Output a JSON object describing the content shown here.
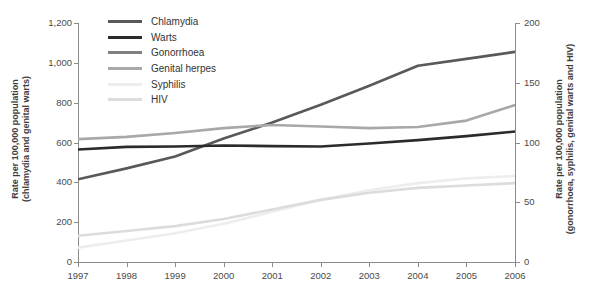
{
  "chart_data": {
    "type": "line",
    "title": "",
    "xlabel": "",
    "ylabel": "Rate per 100,000 population\n(chlamydia and genital warts)",
    "y2label": "Rate per 100,000 population\n(gonorrhoea, syphilis, genital warts and HIV)",
    "x": [
      1997,
      1998,
      1999,
      2000,
      2001,
      2002,
      2003,
      2004,
      2005,
      2006
    ],
    "xtick_labels": [
      "1997",
      "1998",
      "1999",
      "2000",
      "2001",
      "2002",
      "2003",
      "2004",
      "2005",
      "2006"
    ],
    "ylim": [
      0,
      1200
    ],
    "ytick_labels": [
      "0",
      "200",
      "400",
      "600",
      "800",
      "1,000",
      "1,200"
    ],
    "ytick_values": [
      0,
      200,
      400,
      600,
      800,
      1000,
      1200
    ],
    "y2lim": [
      0,
      200
    ],
    "y2tick_labels": [
      "0",
      "50",
      "100",
      "150",
      "200"
    ],
    "y2tick_values": [
      0,
      50,
      100,
      150,
      200
    ],
    "grid": false,
    "legend_position": "top-left",
    "series": [
      {
        "name": "Chlamydia",
        "axis": "left",
        "color": "#595959",
        "width": 2.6,
        "values": [
          415,
          470,
          530,
          620,
          700,
          790,
          885,
          985,
          1020,
          1055
        ]
      },
      {
        "name": "Warts",
        "axis": "left",
        "color": "#2b2b2b",
        "width": 2.6,
        "values": [
          565,
          578,
          580,
          585,
          582,
          580,
          595,
          612,
          632,
          655
        ]
      },
      {
        "name": "Gonorrhoea",
        "axis": "left_scaled",
        "color": "#808080",
        "width": 2.6,
        "values": [
          573,
          592,
          700,
          960,
          1065,
          1118,
          1095,
          975,
          782,
          795
        ]
      },
      {
        "name": "Genital herpes",
        "axis": "left",
        "color": "#a8a8a8",
        "width": 2.6,
        "values": [
          617,
          628,
          648,
          672,
          688,
          680,
          672,
          678,
          710,
          788
        ]
      },
      {
        "name": "Syphilis",
        "axis": "left_scaled",
        "color": "#ededed",
        "width": 2.6,
        "values": [
          12,
          18,
          24,
          32,
          42,
          52,
          60,
          66,
          70,
          72
        ]
      },
      {
        "name": "HIV",
        "axis": "left_scaled",
        "color": "#dcdcdc",
        "width": 2.6,
        "values": [
          22,
          26,
          30,
          36,
          44,
          52,
          58,
          62,
          64,
          66
        ]
      }
    ]
  },
  "legend": {
    "items": [
      {
        "label": "Chlamydia",
        "color": "#595959"
      },
      {
        "label": "Warts",
        "color": "#2b2b2b"
      },
      {
        "label": "Gonorrhoea",
        "color": "#808080"
      },
      {
        "label": "Genital herpes",
        "color": "#a8a8a8"
      },
      {
        "label": "Syphilis",
        "color": "#ededed"
      },
      {
        "label": "HIV",
        "color": "#dcdcdc"
      }
    ]
  },
  "axes": {
    "left_title": "Rate per 100,000 population\n(chlamydia and genital warts)",
    "right_title": "Rate per 100,000 population\n(gonorrhoea, syphilis, genital warts and HIV)"
  }
}
